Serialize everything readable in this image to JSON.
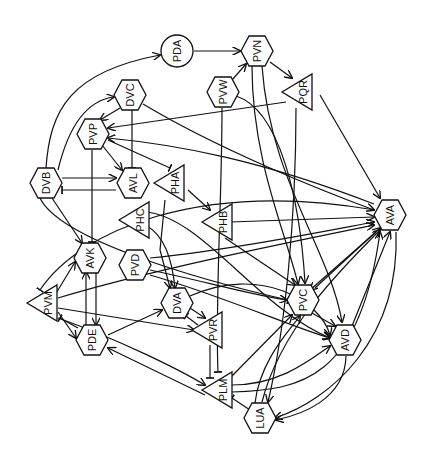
{
  "diagram": {
    "title": "",
    "background": "#ffffff",
    "stroke_color": "#111111",
    "label_rotation_deg": -90,
    "nodes": [
      {
        "id": "PDA",
        "label": "PDA",
        "shape": "circle",
        "x": 177,
        "y": 51
      },
      {
        "id": "PVN",
        "label": "PVN",
        "shape": "hexagon",
        "x": 257,
        "y": 51
      },
      {
        "id": "PVW",
        "label": "PVW",
        "shape": "hexagon",
        "x": 223,
        "y": 92
      },
      {
        "id": "PQR",
        "label": "PQR",
        "shape": "triangle",
        "x": 300,
        "y": 92
      },
      {
        "id": "DVC",
        "label": "DVC",
        "shape": "hexagon",
        "x": 130,
        "y": 95
      },
      {
        "id": "PVP",
        "label": "PVP",
        "shape": "hexagon",
        "x": 93,
        "y": 134
      },
      {
        "id": "DVB",
        "label": "DVB",
        "shape": "hexagon",
        "x": 46,
        "y": 183
      },
      {
        "id": "AVL",
        "label": "AVL",
        "shape": "hexagon",
        "x": 133,
        "y": 183
      },
      {
        "id": "PHA",
        "label": "PHA",
        "shape": "triangle",
        "x": 172,
        "y": 183
      },
      {
        "id": "PHC",
        "label": "PHC",
        "shape": "triangle",
        "x": 137,
        "y": 220
      },
      {
        "id": "PHB",
        "label": "PHB",
        "shape": "triangle",
        "x": 220,
        "y": 222
      },
      {
        "id": "AVA",
        "label": "AVA",
        "shape": "hexagon",
        "x": 390,
        "y": 215
      },
      {
        "id": "PVD",
        "label": "PVD",
        "shape": "hexagon",
        "x": 135,
        "y": 265
      },
      {
        "id": "AVK",
        "label": "AVK",
        "shape": "hexagon",
        "x": 90,
        "y": 258
      },
      {
        "id": "PVM",
        "label": "PVM",
        "shape": "triangle",
        "x": 45,
        "y": 303
      },
      {
        "id": "DVA",
        "label": "DVA",
        "shape": "hexagon",
        "x": 177,
        "y": 303
      },
      {
        "id": "PVC",
        "label": "PVC",
        "shape": "hexagon",
        "x": 303,
        "y": 300
      },
      {
        "id": "PDE",
        "label": "PDE",
        "shape": "hexagon",
        "x": 92,
        "y": 340
      },
      {
        "id": "PVR",
        "label": "PVR",
        "shape": "triangle",
        "x": 210,
        "y": 330
      },
      {
        "id": "AVD",
        "label": "AVD",
        "shape": "hexagon",
        "x": 345,
        "y": 340
      },
      {
        "id": "PLM",
        "label": "PLM",
        "shape": "triangle",
        "x": 220,
        "y": 390
      },
      {
        "id": "LUA",
        "label": "LUA",
        "shape": "hexagon",
        "x": 260,
        "y": 418
      }
    ],
    "edges": [
      {
        "from": "PDA",
        "to": "PVN",
        "type": "arrow",
        "path": "M194,51 L240,51"
      },
      {
        "from": "DVB",
        "to": "PDA",
        "type": "arrow",
        "path": "M46,168 C50,110 70,72 160,55"
      },
      {
        "from": "DVB",
        "to": "DVC",
        "type": "arrow",
        "path": "M58,170 C70,120 90,100 114,97"
      },
      {
        "from": "PVW",
        "to": "PVN",
        "type": "arrow",
        "path": "M232,80 L246,64"
      },
      {
        "from": "PVN",
        "to": "PQR",
        "type": "arrow",
        "path": "M270,62 L292,78"
      },
      {
        "from": "PVN",
        "to": "PVC",
        "type": "arrow",
        "path": "M252,66 C252,160 285,230 298,284"
      },
      {
        "from": "PVN",
        "to": "AVD",
        "type": "arrow",
        "path": "M262,66 C270,180 330,250 342,322"
      },
      {
        "from": "PVW",
        "to": "PVC",
        "type": "arrow",
        "path": "M236,96 C280,110 300,200 305,283"
      },
      {
        "from": "PVW",
        "to": "PLM",
        "type": "tbar",
        "path": "M222,108 C222,200 215,300 218,372"
      },
      {
        "from": "PQR",
        "to": "AVA",
        "type": "arrow",
        "path": "M320,95 L380,198"
      },
      {
        "from": "PQR",
        "to": "LUA",
        "type": "arrow",
        "path": "M296,108 C296,220 285,330 268,402"
      },
      {
        "from": "DVC",
        "to": "PVP",
        "type": "arrow",
        "path": "M120,108 L100,120"
      },
      {
        "from": "DVC",
        "to": "AVL",
        "type": "tbar",
        "path": "M132,110 L132,168"
      },
      {
        "from": "DVC",
        "to": "AVA",
        "type": "arrow",
        "path": "M143,104 C220,150 320,190 374,210"
      },
      {
        "from": "AVA",
        "to": "PVP",
        "type": "arrow",
        "path": "M374,204 C260,160 180,145 108,138"
      },
      {
        "from": "PQR",
        "to": "PVP",
        "type": "arrow",
        "path": "M286,102 L108,128"
      },
      {
        "from": "PVP",
        "to": "AVL",
        "type": "arrow",
        "path": "M102,145 L122,170"
      },
      {
        "from": "PVP",
        "to": "PHA",
        "type": "tbar",
        "path": "M108,140 L170,168"
      },
      {
        "from": "PVP",
        "to": "AVK",
        "type": "tbar",
        "path": "M92,150 L92,242"
      },
      {
        "from": "DVB",
        "to": "AVL",
        "type": "arrow",
        "path": "M62,178 L116,178"
      },
      {
        "from": "AVL",
        "to": "DVB",
        "type": "tbar",
        "path": "M116,190 L62,190"
      },
      {
        "from": "DVB",
        "to": "AVK",
        "type": "arrow",
        "path": "M52,198 L82,243"
      },
      {
        "from": "DVB",
        "to": "PVC",
        "type": "tbar",
        "path": "M40,198 C60,240 200,280 288,300"
      },
      {
        "from": "PHA",
        "to": "PHB",
        "type": "arrow",
        "path": "M188,190 L210,210"
      },
      {
        "from": "PHA",
        "to": "DVA",
        "type": "arrow",
        "path": "M165,200 L160,250 L170,288"
      },
      {
        "from": "PHC",
        "to": "DVA",
        "type": "arrow",
        "path": "M145,225 C165,235 172,260 175,288"
      },
      {
        "from": "PHC",
        "to": "AVD",
        "type": "arrow",
        "path": "M145,212 C200,215 260,310 330,338"
      },
      {
        "from": "PHB",
        "to": "AVA",
        "type": "arrow",
        "path": "M230,222 L374,217"
      },
      {
        "from": "PHB",
        "to": "PVC",
        "type": "arrow",
        "path": "M225,238 L295,285"
      },
      {
        "from": "PVD",
        "to": "AVA",
        "type": "arrow",
        "path": "M150,258 C230,250 320,232 374,222"
      },
      {
        "from": "PVD",
        "to": "PVC",
        "type": "arrow",
        "path": "M150,270 C200,280 250,295 287,300"
      },
      {
        "from": "PVD",
        "to": "AVD",
        "type": "arrow",
        "path": "M150,275 C220,295 300,330 330,338"
      },
      {
        "from": "AVK",
        "to": "PDE",
        "type": "arrow",
        "path": "M96,272 L96,325"
      },
      {
        "from": "PDE",
        "to": "AVK",
        "type": "arrow",
        "path": "M86,325 L86,272"
      },
      {
        "from": "PVM",
        "to": "AVK",
        "type": "arrow",
        "path": "M55,295 L75,262"
      },
      {
        "from": "PVM",
        "to": "AVA",
        "type": "arrow",
        "path": "M58,298 C150,270 300,240 374,225"
      },
      {
        "from": "PVM",
        "to": "PVR",
        "type": "arrow",
        "path": "M58,308 L194,330"
      },
      {
        "from": "PVM",
        "to": "PDE",
        "type": "arrow",
        "path": "M58,312 L76,338"
      },
      {
        "from": "PDE",
        "to": "PVM",
        "type": "tbar",
        "path": "M78,328 L60,318"
      },
      {
        "from": "PVM",
        "to": "PLM",
        "type": "arrow",
        "path": "M58,318 C120,340 180,370 205,385"
      },
      {
        "from": "AVA",
        "to": "PVM",
        "type": "tbar",
        "path": "M375,210 C200,180 80,230 40,290"
      },
      {
        "from": "PDE",
        "to": "DVA",
        "type": "arrow",
        "path": "M108,335 L162,310"
      },
      {
        "from": "DVA",
        "to": "PVR",
        "type": "arrow",
        "path": "M190,308 L205,318"
      },
      {
        "from": "PVR",
        "to": "DVA",
        "type": "tbar",
        "path": "M198,325 L186,316"
      },
      {
        "from": "DVA",
        "to": "AVD",
        "type": "arrow",
        "path": "M190,296 C260,265 320,300 330,335"
      },
      {
        "from": "PVR",
        "to": "PLM",
        "type": "tbar",
        "path": "M210,345 L210,378"
      },
      {
        "from": "PLM",
        "to": "PDE",
        "type": "arrow",
        "path": "M205,395 L108,348"
      },
      {
        "from": "PLM",
        "to": "PVC",
        "type": "arrow",
        "path": "M230,378 L292,315"
      },
      {
        "from": "PLM",
        "to": "AVD",
        "type": "arrow",
        "path": "M232,385 C280,385 310,360 330,346"
      },
      {
        "from": "PLM",
        "to": "AVA",
        "type": "arrow",
        "path": "M232,392 C300,390 360,380 380,232"
      },
      {
        "from": "LUA",
        "to": "PLM",
        "type": "tbar",
        "path": "M250,410 L232,398"
      },
      {
        "from": "LUA",
        "to": "PVC",
        "type": "arrow",
        "path": "M255,403 C260,360 290,330 300,316"
      },
      {
        "from": "LUA",
        "to": "AVA",
        "type": "arrow",
        "path": "M262,402 C280,330 340,270 380,230"
      },
      {
        "from": "AVA",
        "to": "LUA",
        "type": "arrow",
        "path": "M396,232 C400,340 330,400 275,418"
      },
      {
        "from": "PVC",
        "to": "AVA",
        "type": "arrow",
        "path": "M315,288 L380,228"
      },
      {
        "from": "AVA",
        "to": "PVC",
        "type": "arrow",
        "path": "M376,232 L310,290"
      },
      {
        "from": "PVC",
        "to": "AVD",
        "type": "arrow",
        "path": "M312,313 L335,326"
      },
      {
        "from": "AVD",
        "to": "AVA",
        "type": "arrow",
        "path": "M352,326 L390,232"
      },
      {
        "from": "AVD",
        "to": "LUA",
        "type": "arrow",
        "path": "M346,356 C345,400 300,415 276,420"
      }
    ]
  }
}
